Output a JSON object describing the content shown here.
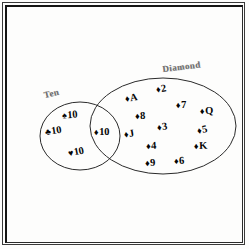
{
  "figure": {
    "type": "venn-diagram",
    "title": "",
    "background_color": "#fdfdfc",
    "ink_color": "#050505",
    "label_color": "#6f6f6f"
  },
  "sets": [
    {
      "id": "ten",
      "label": "Ten",
      "shape": "circle",
      "cx": 80,
      "cy": 136,
      "rx": 40,
      "ry": 34
    },
    {
      "id": "diamond",
      "label": "Diamond",
      "shape": "ellipse",
      "cx": 163,
      "cy": 126,
      "rx": 73,
      "ry": 48
    }
  ],
  "regions": {
    "ten_only": {
      "name": "Ten only",
      "cards": [
        {
          "suit": "spade",
          "pip": "♠",
          "rank": "10",
          "x": 62,
          "y": 110,
          "rotate": -4
        },
        {
          "suit": "club",
          "pip": "♣",
          "rank": "10",
          "x": 45,
          "y": 126,
          "rotate": -9
        },
        {
          "suit": "heart",
          "pip": "♥",
          "rank": "10",
          "x": 68,
          "y": 147,
          "rotate": -11
        }
      ]
    },
    "intersection": {
      "name": "Ten and Diamond",
      "cards": [
        {
          "suit": "diamond",
          "pip": "♦",
          "rank": "10",
          "x": 94,
          "y": 127,
          "rotate": -1
        }
      ]
    },
    "diamond_only": {
      "name": "Diamond only",
      "cards": [
        {
          "suit": "diamond",
          "pip": "♦",
          "rank": "A",
          "x": 125,
          "y": 93,
          "rotate": -9
        },
        {
          "suit": "diamond",
          "pip": "♦",
          "rank": "2",
          "x": 156,
          "y": 84,
          "rotate": -9
        },
        {
          "suit": "diamond",
          "pip": "♦",
          "rank": "7",
          "x": 176,
          "y": 100,
          "rotate": -2
        },
        {
          "suit": "diamond",
          "pip": "♦",
          "rank": "Q",
          "x": 200,
          "y": 106,
          "rotate": -2
        },
        {
          "suit": "diamond",
          "pip": "♦",
          "rank": "8",
          "x": 135,
          "y": 111,
          "rotate": -3
        },
        {
          "suit": "diamond",
          "pip": "♦",
          "rank": "3",
          "x": 157,
          "y": 122,
          "rotate": -8
        },
        {
          "suit": "diamond",
          "pip": "♦",
          "rank": "5",
          "x": 197,
          "y": 125,
          "rotate": -12
        },
        {
          "suit": "diamond",
          "pip": "♦",
          "rank": "J",
          "x": 124,
          "y": 129,
          "rotate": -10
        },
        {
          "suit": "diamond",
          "pip": "♦",
          "rank": "4",
          "x": 146,
          "y": 141,
          "rotate": -3
        },
        {
          "suit": "diamond",
          "pip": "♦",
          "rank": "K",
          "x": 194,
          "y": 141,
          "rotate": -2
        },
        {
          "suit": "diamond",
          "pip": "♦",
          "rank": "9",
          "x": 145,
          "y": 158,
          "rotate": -3
        },
        {
          "suit": "diamond",
          "pip": "♦",
          "rank": "6",
          "x": 174,
          "y": 156,
          "rotate": -4
        }
      ]
    }
  },
  "chart_data": {
    "type": "venn",
    "set_labels": [
      "Ten",
      "Diamond"
    ],
    "ten_only": [
      "♠10",
      "♣10",
      "♥10"
    ],
    "intersection": [
      "♦10"
    ],
    "diamond_only": [
      "♦A",
      "♦2",
      "♦3",
      "♦4",
      "♦5",
      "♦6",
      "♦7",
      "♦8",
      "♦9",
      "♦J",
      "♦Q",
      "♦K"
    ],
    "counts": {
      "ten_only": 3,
      "intersection": 1,
      "diamond_only": 12,
      "total": 16
    },
    "grid": false,
    "legend": "none"
  }
}
